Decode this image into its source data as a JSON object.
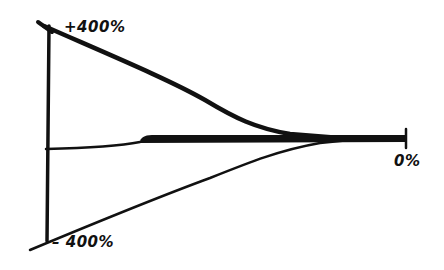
{
  "diagram": {
    "labels": {
      "top": "+400%",
      "bottom": "– 400%",
      "zero": "0%"
    },
    "stroke_color": "#111111",
    "background": "#ffffff"
  }
}
